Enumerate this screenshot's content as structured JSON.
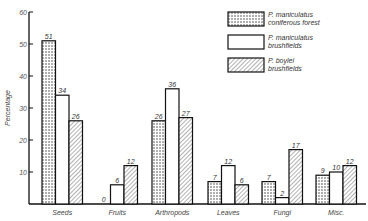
{
  "chart_data": {
    "type": "bar",
    "title": "",
    "xlabel": "",
    "ylabel": "Percentage",
    "ylim": [
      0,
      60
    ],
    "yticks": [
      10,
      20,
      30,
      40,
      50,
      60
    ],
    "grid": false,
    "legend_position": "top-right",
    "categories": [
      "Seeds",
      "Fruits",
      "Arthropods",
      "Leaves",
      "Fungi",
      "Misc."
    ],
    "series": [
      {
        "name": "P. maniculatus coniferous forest",
        "legend_lines": [
          "P. maniculatus",
          "coniferous forest"
        ],
        "pattern": "dotted",
        "values": [
          51,
          0,
          26,
          7,
          7,
          9
        ]
      },
      {
        "name": "P. maniculatus brushfields",
        "legend_lines": [
          "P. maniculatus",
          "brushfields"
        ],
        "pattern": "open",
        "values": [
          34,
          6,
          36,
          12,
          2,
          10
        ]
      },
      {
        "name": "P. boylei brushfields",
        "legend_lines": [
          "P. boylei",
          "brushfields"
        ],
        "pattern": "hatched",
        "values": [
          26,
          12,
          27,
          6,
          17,
          12
        ]
      }
    ]
  }
}
